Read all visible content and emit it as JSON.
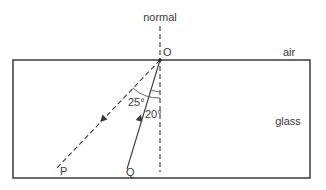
{
  "diagram": {
    "labels": {
      "normal": "normal",
      "point_o": "O",
      "air": "air",
      "glass": "glass",
      "point_p": "P",
      "point_q": "Q",
      "angle_reflected": "25°",
      "angle_incident": "20°"
    },
    "colors": {
      "line": "#3a3a3a",
      "background": "#ffffff"
    }
  }
}
